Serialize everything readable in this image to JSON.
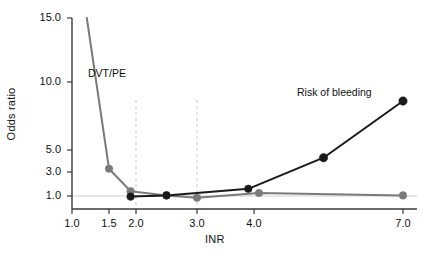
{
  "chart_data": {
    "type": "line",
    "title": "",
    "xlabel": "INR",
    "ylabel": "Odds ratio",
    "grid": false,
    "legend_position": "inline-annotation",
    "x_ticks": [
      1.0,
      1.5,
      2.0,
      3.0,
      4.0,
      7.0
    ],
    "x_tick_labels": [
      "1.0",
      "1.5",
      "2.0",
      "3.0",
      "4.0",
      "7.0"
    ],
    "y_ticks": [
      1.0,
      3.0,
      5.0,
      10.0,
      15.0
    ],
    "y_tick_labels": [
      "1.0",
      "3.0",
      "5.0",
      "10.0",
      "15.0"
    ],
    "ylim": [
      0.6,
      15.0
    ],
    "xlim": [
      1.0,
      7.0
    ],
    "reference_line_y": 1.0,
    "therapeutic_range": [
      2.0,
      3.0
    ],
    "series": [
      {
        "name": "DVT/PE",
        "color": "#7a7a7a",
        "x": [
          1.2,
          1.5,
          1.9,
          2.5,
          3.0,
          4.1,
          7.0
        ],
        "y": [
          15.0,
          3.3,
          1.4,
          1.05,
          0.85,
          1.25,
          1.05
        ]
      },
      {
        "name": "Risk of bleeding",
        "color": "#1a1a1a",
        "x": [
          1.9,
          2.5,
          3.9,
          5.4,
          7.0
        ],
        "y": [
          0.95,
          1.05,
          1.6,
          4.3,
          8.6
        ]
      }
    ],
    "annotations": [
      {
        "text": "DVT/PE",
        "x": 1.35,
        "y": 9.6
      },
      {
        "text": "Risk of bleeding",
        "x": 5.1,
        "y": 7.6
      }
    ]
  },
  "axes": {
    "y_title": "Odds ratio",
    "x_title": "INR",
    "y_labels": [
      "15.0",
      "10.0",
      "5.0",
      "3.0",
      "1.0"
    ],
    "x_labels": [
      "1.0",
      "1.5",
      "2.0",
      "3.0",
      "4.0",
      "7.0"
    ]
  },
  "labels": {
    "dvtpe": "DVT/PE",
    "bleeding": "Risk of bleeding"
  },
  "colors": {
    "dvtpe_line": "#7a7a7a",
    "bleeding_line": "#1a1a1a",
    "axis": "#3a3a3a",
    "dashed_guide": "#c8c8c8",
    "reference_line": "#cfcfcf",
    "background": "#ffffff"
  }
}
